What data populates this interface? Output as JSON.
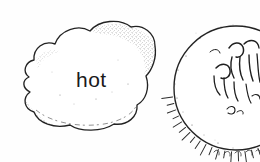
{
  "scene": {
    "title": "hot weather illustration",
    "background_color": "#fefefe",
    "ink_color": "#1a1a1a",
    "width": 260,
    "height": 162
  },
  "cloud": {
    "label": "hot",
    "label_color": "#1a1a1a",
    "outline_color": "#242424",
    "fill_color": "#ffffff",
    "texture": "stippled"
  },
  "sun": {
    "label": "",
    "outline_color": "#242424",
    "fill_color": "#ffffff",
    "rays": "short-dashes",
    "clipped_edge": "right",
    "scribble_marks": "sketchy interior shading"
  }
}
